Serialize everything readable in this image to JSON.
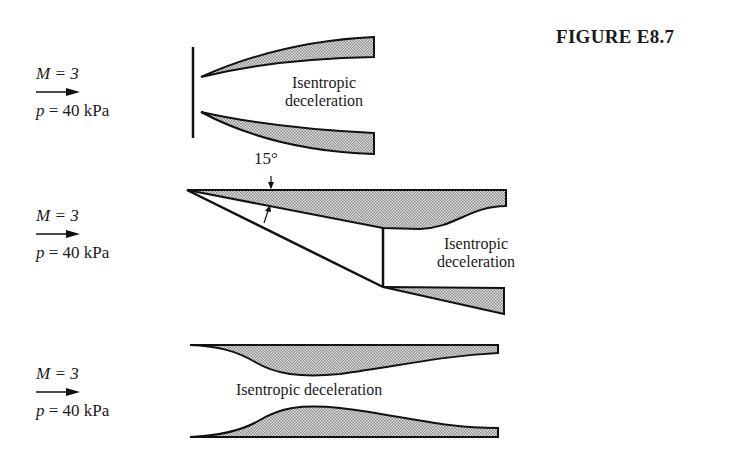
{
  "figure": {
    "title": "FIGURE E8.7"
  },
  "panels": [
    {
      "id": "inlet-normal-shock",
      "flow": {
        "mach": "M = 3",
        "pressure_var": "p",
        "pressure": " = 40 kPa"
      },
      "label_line1": "Isentropic",
      "label_line2": "deceleration"
    },
    {
      "id": "inlet-oblique-shock",
      "flow": {
        "mach": "M = 3",
        "pressure_var": "p",
        "pressure": " = 40 kPa"
      },
      "angle_label": "15°",
      "label_line1": "Isentropic",
      "label_line2": "deceleration"
    },
    {
      "id": "inlet-isentropic",
      "flow": {
        "mach": "M = 3",
        "pressure_var": "p",
        "pressure": " = 40 kPa"
      },
      "label": "Isentropic deceleration"
    }
  ],
  "colors": {
    "line": "#111111",
    "fill": "#bdbdbd",
    "background": "#ffffff"
  }
}
